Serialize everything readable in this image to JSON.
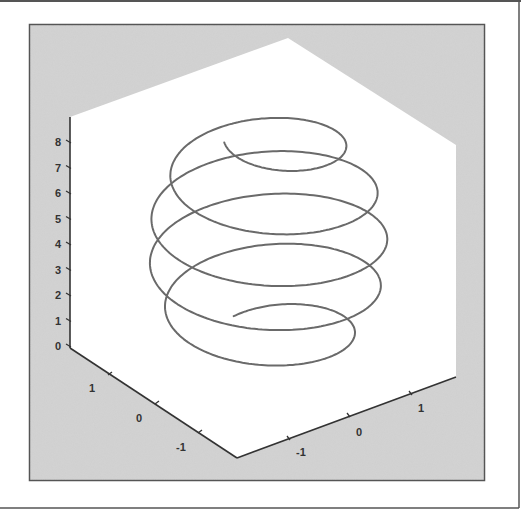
{
  "chart_data": {
    "type": "line3d",
    "title": "",
    "xlabel": "",
    "ylabel": "",
    "zlabel": "",
    "x_ticks": [
      "1",
      "0",
      "-1"
    ],
    "y_ticks": [
      "-1",
      "0",
      "1"
    ],
    "z_ticks": [
      "0",
      "1",
      "2",
      "3",
      "4",
      "5",
      "6",
      "7",
      "8"
    ],
    "xlim": [
      -1.85,
      1.85
    ],
    "ylim": [
      -1.85,
      1.85
    ],
    "zlim": [
      0,
      9
    ],
    "series": [
      {
        "name": "helix",
        "parametric": "x = r(z)·cos(t), y = r(z)·sin(t), z = 9·t/(2π·turns)",
        "turns": 4.75,
        "z_start": 0.6,
        "z_end": 9.0,
        "max_radius": 1.55,
        "color": "#6a6a6a"
      }
    ],
    "grid": false,
    "legend": null
  },
  "colors": {
    "background_panel": "#cfcfcf",
    "axes_face": "#ffffff",
    "frame_border": "#555555",
    "line": "#6a6a6a",
    "axis": "#333333"
  }
}
